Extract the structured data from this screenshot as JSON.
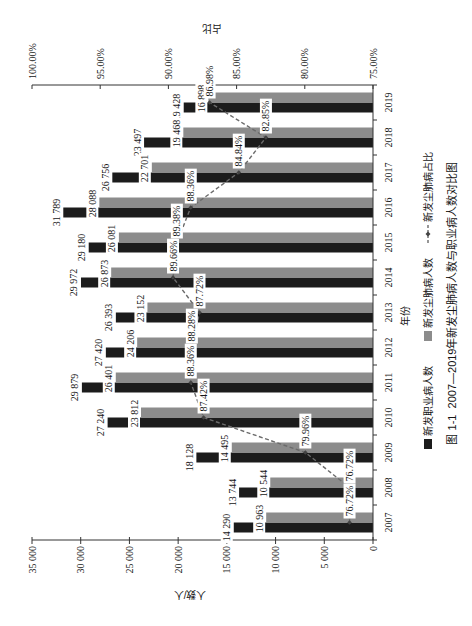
{
  "chart_data": {
    "type": "bar",
    "title": "",
    "caption": "图 1-1  2007—2019年新发尘肺病人数与职业病人数对比图",
    "categories": [
      "2007",
      "2008",
      "2009",
      "2010",
      "2011",
      "2012",
      "2013",
      "2014",
      "2015",
      "2016",
      "2017",
      "2018",
      "2019"
    ],
    "xlabel": "年份",
    "ylabel": "人数/人",
    "y2label": "占比",
    "ylim": [
      0,
      35000
    ],
    "yticks": [
      0,
      5000,
      10000,
      15000,
      20000,
      25000,
      30000,
      35000
    ],
    "ytick_labels": [
      "0",
      "5 000",
      "10 000",
      "15 000",
      "20 000",
      "25 000",
      "30 000",
      "35 000"
    ],
    "y2lim": [
      75,
      100
    ],
    "y2ticks": [
      75,
      80,
      85,
      90,
      95,
      100
    ],
    "y2tick_labels": [
      "75.00%",
      "80.00%",
      "85.00%",
      "90.00%",
      "95.00%",
      "100.00%"
    ],
    "grid": false,
    "legend": {
      "position": "bottom"
    },
    "series": [
      {
        "name": "新发职业病人数",
        "type": "bar",
        "axis": "left",
        "color": "#1c1c1c",
        "values": [
          14290,
          13744,
          18128,
          27240,
          29879,
          27420,
          26393,
          29972,
          29180,
          31789,
          26756,
          23497,
          19428
        ],
        "labels": [
          "14 290",
          "13 744",
          "18 128",
          "27 240",
          "29 879",
          "27 420",
          "26 393",
          "29 972",
          "29 180",
          "31 789",
          "26 756",
          "23 497",
          "19 428"
        ]
      },
      {
        "name": "新发尘肺病人数",
        "type": "bar",
        "axis": "left",
        "color": "#8c8c8c",
        "values": [
          10963,
          10544,
          14495,
          23812,
          26401,
          24206,
          23152,
          26873,
          26081,
          28088,
          22701,
          19468,
          16898
        ],
        "labels": [
          "10 963",
          "10 544",
          "14 495",
          "23 812",
          "26 401",
          "24 206",
          "23 152",
          "26 873",
          "26 081",
          "28 088",
          "22 701",
          "19 468",
          "16 898"
        ]
      },
      {
        "name": "新发尘肺病占比",
        "type": "line",
        "axis": "right",
        "color": "#6b6b6b",
        "line_style": "dashed",
        "marker": "diamond",
        "values": [
          76.72,
          76.72,
          79.96,
          87.42,
          88.36,
          88.28,
          87.72,
          89.66,
          89.38,
          88.36,
          84.84,
          82.85,
          86.98
        ],
        "labels": [
          "76.72%",
          "76.72%",
          "79.96%",
          "87.42%",
          "88.36%",
          "88.28%",
          "87.72%",
          "89.66%",
          "89.38%",
          "88.36%",
          "84.84%",
          "82.85%",
          "86.98%"
        ]
      }
    ]
  }
}
